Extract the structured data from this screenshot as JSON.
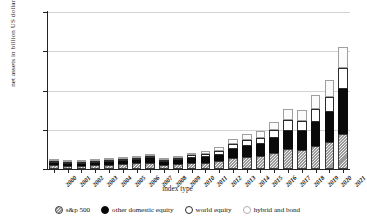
{
  "chart_data": {
    "type": "bar",
    "stacked": true,
    "title": "",
    "xlabel": "index type",
    "ylabel": "net assets in billion US dollars",
    "ylim": [
      0,
      8000
    ],
    "yticks": [
      0,
      2000,
      4000,
      6000,
      8000
    ],
    "ytick_labels": [
      "0",
      "2,000",
      "4,000",
      "6,000",
      "8,000"
    ],
    "grid": true,
    "legend_position": "bottom",
    "categories": [
      "2000",
      "2001",
      "2002",
      "2003",
      "2004",
      "2005",
      "2006",
      "2007",
      "2008",
      "2009",
      "2010",
      "2011",
      "2012",
      "2013",
      "2014",
      "2015",
      "2016",
      "2017",
      "2018",
      "2019",
      "2020",
      "2021"
    ],
    "series": [
      {
        "name": "s&p 500",
        "color": "#9a9a9a",
        "pattern": "hatched",
        "values": [
          180,
          170,
          140,
          190,
          215,
          245,
          285,
          310,
          200,
          255,
          310,
          330,
          395,
          540,
          620,
          665,
          805,
          1000,
          965,
          1190,
          1390,
          1760
        ]
      },
      {
        "name": "other domestic equity",
        "color": "#0a0a0a",
        "pattern": "solid",
        "values": [
          95,
          90,
          80,
          110,
          135,
          165,
          200,
          235,
          150,
          200,
          255,
          280,
          330,
          470,
          560,
          610,
          760,
          960,
          950,
          1230,
          1510,
          2310
        ]
      },
      {
        "name": "world equity",
        "color": "#ffffff",
        "pattern": "outline",
        "values": [
          35,
          30,
          25,
          40,
          55,
          75,
          100,
          130,
          80,
          105,
          135,
          145,
          175,
          250,
          295,
          320,
          400,
          560,
          540,
          660,
          790,
          1080
        ]
      },
      {
        "name": "hybrid and bond",
        "color": "#fbfbfb",
        "pattern": "outline-light",
        "values": [
          25,
          25,
          30,
          40,
          50,
          60,
          75,
          90,
          70,
          100,
          135,
          165,
          210,
          265,
          310,
          345,
          420,
          530,
          560,
          690,
          840,
          1060
        ]
      }
    ],
    "totals": [
      335,
      315,
      275,
      380,
      455,
      545,
      660,
      765,
      500,
      660,
      835,
      920,
      1110,
      1525,
      1785,
      1940,
      2385,
      3050,
      3015,
      3770,
      4530,
      6210
    ]
  },
  "legend": {
    "items": [
      {
        "label": "s&p 500",
        "swatch": "hatched-circle-icon"
      },
      {
        "label": "other domestic equity",
        "swatch": "filled-circle-icon"
      },
      {
        "label": "world equity",
        "swatch": "open-circle-icon"
      },
      {
        "label": "hybrid and bond",
        "swatch": "light-circle-icon"
      }
    ]
  }
}
